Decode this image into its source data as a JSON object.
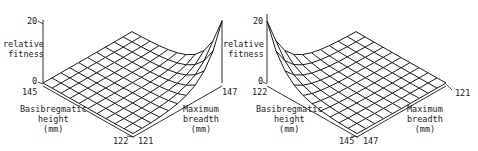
{
  "chart_data": [
    {
      "type": "surface",
      "title": "",
      "zlabel": "relative fitness",
      "zlim": [
        0,
        20
      ],
      "z_ticks": [
        "0",
        "20"
      ],
      "x_axis": {
        "label": "Basibregmatic height (mm)",
        "range_labels": [
          "145",
          "122"
        ]
      },
      "y_axis": {
        "label": "Maximum breadth (mm)",
        "range_labels": [
          "121",
          "147"
        ]
      },
      "grid_size": [
        10,
        10
      ],
      "peak": {
        "height_mm": 145,
        "breadth_mm": 147,
        "relative_fitness": 20
      },
      "description": "Fitness surface is nearly flat (~0) across most of the domain and rises steeply toward the corner with basibregmatic height 145 and maximum breadth 147."
    },
    {
      "type": "surface",
      "title": "",
      "zlabel": "relative fitness",
      "zlim": [
        0,
        20
      ],
      "z_ticks": [
        "0",
        "20"
      ],
      "x_axis": {
        "label": "Basibregmatic height (mm)",
        "range_labels": [
          "122",
          "145"
        ]
      },
      "y_axis": {
        "label": "Maximum breadth (mm)",
        "range_labels": [
          "147",
          "121"
        ]
      },
      "grid_size": [
        10,
        10
      ],
      "peak": {
        "height_mm": 122,
        "breadth_mm": 121,
        "relative_fitness": 20
      },
      "description": "Same surface viewed from the opposite corner: peak of ~20 at height 122 / breadth 121, nearly flat elsewhere."
    }
  ],
  "left": {
    "z_top": "20",
    "z_zero": "0",
    "zlabel": "relative\nfitness",
    "h_far": "145",
    "h_near": "122",
    "b_near": "121",
    "b_far": "147",
    "xlabel": "Basibregmatic\nheight\n(mm)",
    "ylabel": "Maximum\nbreadth\n(mm)"
  },
  "right": {
    "z_top": "20",
    "z_zero": "0",
    "zlabel": "relative\nfitness",
    "h_far": "122",
    "h_near": "145",
    "b_near": "147",
    "b_far": "121",
    "xlabel": "Basibregmatic\nheight\n(mm)",
    "ylabel": "Maximum\nbreadth\n(mm)"
  },
  "render": {
    "line_color": "#1a1a1a",
    "grid_n": 10,
    "peak_scale": 62,
    "decay": 3.2
  }
}
